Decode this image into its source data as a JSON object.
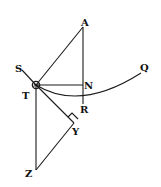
{
  "diagram": {
    "type": "geometric-figure",
    "style": {
      "ink": "#1a1a1a",
      "background": "#ffffff"
    },
    "labels": {
      "A": "A",
      "S": "S",
      "T": "T",
      "N": "N",
      "Q": "Q",
      "R": "R",
      "Y": "Y",
      "Z": "Z"
    },
    "points": {
      "A": [
        83,
        27
      ],
      "S": [
        22,
        70
      ],
      "T": [
        36,
        85
      ],
      "N": [
        83,
        85
      ],
      "R": [
        83,
        101
      ],
      "Q": [
        141,
        73
      ],
      "Y": [
        74,
        123
      ],
      "Z": [
        36,
        170
      ]
    },
    "segments": [
      [
        "T",
        "A"
      ],
      [
        "A",
        "N"
      ],
      [
        "N",
        "R"
      ],
      [
        "T",
        "N"
      ],
      [
        "S",
        "T"
      ],
      [
        "T",
        "Y"
      ],
      [
        "T",
        "Z"
      ],
      [
        "Z",
        "Y"
      ]
    ],
    "curves": [
      {
        "name": "arc-TRQ",
        "through": [
          "T",
          "R",
          "Q"
        ]
      }
    ],
    "markers": [
      {
        "type": "right-angle",
        "at": "Y"
      },
      {
        "type": "body-circle",
        "at": "T"
      }
    ]
  }
}
